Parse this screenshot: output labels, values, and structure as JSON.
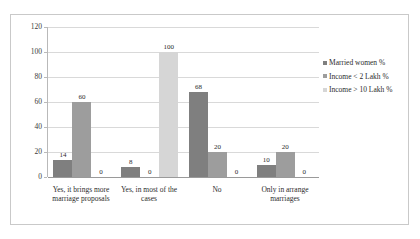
{
  "chart_data": {
    "type": "bar",
    "title": "",
    "xlabel": "",
    "ylabel": "",
    "ylim": [
      0,
      120
    ],
    "yticks": [
      0,
      20,
      40,
      60,
      80,
      100,
      120
    ],
    "grid": true,
    "legend_position": "right",
    "categories": [
      "Yes, it brings more marriage proposals",
      "Yes, in most of the cases",
      "No",
      "Only in arrange marriages"
    ],
    "category_lines": [
      [
        "Yes, it brings more",
        "marriage proposals"
      ],
      [
        "Yes, in most of the",
        "cases"
      ],
      [
        "No",
        ""
      ],
      [
        "Only in arrange",
        "marriages"
      ]
    ],
    "series": [
      {
        "name": "Married women %",
        "color": "#7f7f7f",
        "values": [
          14,
          8,
          68,
          10
        ],
        "labels": [
          "14",
          "8",
          "68",
          "10"
        ]
      },
      {
        "name": "Income < 2 Lakh %",
        "color": "#9d9d9d",
        "values": [
          60,
          0,
          20,
          20
        ],
        "labels": [
          "60",
          "0",
          "20",
          "20"
        ]
      },
      {
        "name": "Income > 10 Lakh %",
        "color": "#d6d6d6",
        "values": [
          0,
          100,
          0,
          0
        ],
        "labels": [
          "0",
          "100",
          "0",
          "0"
        ]
      }
    ]
  }
}
